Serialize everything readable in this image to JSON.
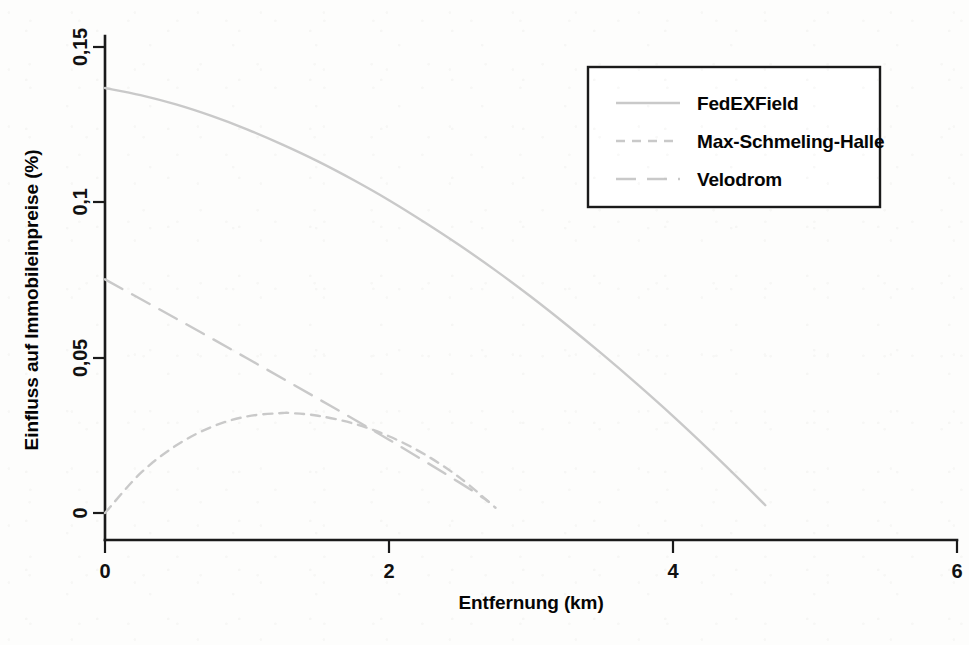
{
  "chart_data": {
    "type": "line",
    "title": "",
    "xlabel": "Entfernung (km)",
    "ylabel": "Einfluss auf Immobileinpreise (%)",
    "xlim": [
      0,
      6
    ],
    "ylim": [
      -0.004,
      0.155
    ],
    "xticks": [
      "0",
      "2",
      "4",
      "6"
    ],
    "xtick_values": [
      0,
      2,
      4,
      6
    ],
    "yticks": [
      "0",
      "0,05",
      "0,1",
      "0,15"
    ],
    "ytick_values": [
      0,
      0.05,
      0.1,
      0.15
    ],
    "grid": false,
    "legend_position": "top-right",
    "line_color": "#c9c9c9",
    "axis_color": "#1a1a1a",
    "background_color": "#fdfdfc",
    "series": [
      {
        "name": "FedEXField",
        "style": "solid",
        "x": [
          0,
          0.25,
          0.5,
          0.75,
          1,
          1.25,
          1.5,
          1.75,
          2,
          2.25,
          2.5,
          2.75,
          3,
          3.25,
          3.5,
          3.75,
          4,
          4.25,
          4.5,
          4.65
        ],
        "values": [
          0.1368,
          0.1345,
          0.1315,
          0.1278,
          0.1235,
          0.1186,
          0.1132,
          0.1072,
          0.1007,
          0.0936,
          0.0861,
          0.0781,
          0.0696,
          0.0606,
          0.0512,
          0.0414,
          0.0312,
          0.0205,
          0.0094,
          0.0025
        ]
      },
      {
        "name": "Max-Schmeling-Halle",
        "style": "dashed-short",
        "x": [
          0,
          0.25,
          0.5,
          0.75,
          1,
          1.25,
          1.3,
          1.5,
          1.75,
          2,
          2.25,
          2.5,
          2.75
        ],
        "values": [
          0.0,
          0.0128,
          0.0217,
          0.0277,
          0.0311,
          0.0322,
          0.0322,
          0.0313,
          0.0288,
          0.0247,
          0.0189,
          0.0113,
          0.0017
        ]
      },
      {
        "name": "Velodrom",
        "style": "dashed-long",
        "x": [
          0,
          0.5,
          1,
          1.5,
          2,
          2.5,
          2.7
        ],
        "values": [
          0.0752,
          0.0626,
          0.0498,
          0.0368,
          0.0236,
          0.0097,
          0.0037
        ]
      }
    ],
    "annotations": []
  },
  "legend": {
    "entries": [
      {
        "label": "FedEXField",
        "style": "solid"
      },
      {
        "label": "Max-Schmeling-Halle",
        "style": "dashed-short"
      },
      {
        "label": "Velodrom",
        "style": "dashed-long"
      }
    ]
  }
}
